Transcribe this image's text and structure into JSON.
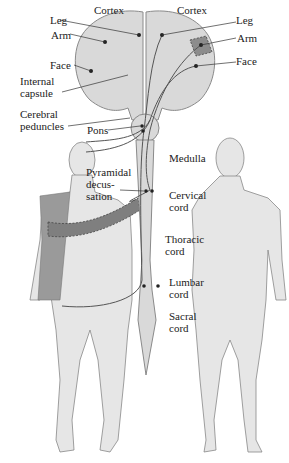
{
  "figure": {
    "colors": {
      "tissue_fill": "#d9d9d9",
      "tissue_stroke": "#8a8a8a",
      "pathway": "#555555",
      "highlight_region": "#8c8c8c",
      "body_fill": "#e4e4e4",
      "highlight_body": "#9a9a9a"
    }
  },
  "labels": {
    "cortex_left": "Cortex",
    "cortex_right": "Cortex",
    "leg_left": "Leg",
    "arm_left": "Arm",
    "face_left": "Face",
    "internal_capsule_1": "Internal",
    "internal_capsule_2": "capsule",
    "cerebral_peduncles_1": "Cerebral",
    "cerebral_peduncles_2": "peduncles",
    "pons": "Pons",
    "pyramidal_1": "Pyramidal",
    "pyramidal_2": "decus-",
    "pyramidal_3": "sation",
    "leg_right": "Leg",
    "arm_right": "Arm",
    "face_right": "Face",
    "medulla": "Medulla",
    "cervical_1": "Cervical",
    "cervical_2": "cord",
    "thoracic_1": "Thoracic",
    "thoracic_2": "cord",
    "lumbar_1": "Lumbar",
    "lumbar_2": "cord",
    "sacral_1": "Sacral",
    "sacral_2": "cord"
  }
}
